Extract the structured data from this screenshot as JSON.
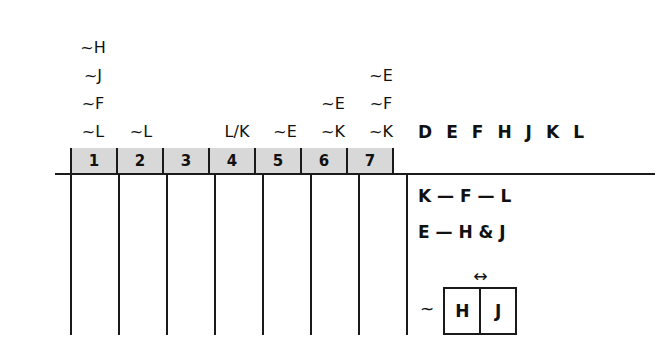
{
  "diagram": {
    "roster": {
      "label": "entity-roster",
      "entities": [
        "D",
        "E",
        "F",
        "H",
        "J",
        "K",
        "L"
      ]
    },
    "slots": {
      "numbers": [
        "1",
        "2",
        "3",
        "4",
        "5",
        "6",
        "7"
      ],
      "band_color": "#d8d8d8"
    },
    "column_annotations": [
      {
        "slot": "1",
        "notes": [
          "~H",
          "~J",
          "~F",
          "~L"
        ]
      },
      {
        "slot": "2",
        "notes": [
          "~L"
        ]
      },
      {
        "slot": "3",
        "notes": []
      },
      {
        "slot": "4",
        "notes": [
          "L/K"
        ]
      },
      {
        "slot": "5",
        "notes": [
          "~E"
        ]
      },
      {
        "slot": "6",
        "notes": [
          "~E",
          "~K"
        ]
      },
      {
        "slot": "7",
        "notes": [
          "~E",
          "~F",
          "~K"
        ]
      }
    ],
    "rules": [
      {
        "name": "chain-rule-kfl",
        "text": "K — F — L"
      },
      {
        "name": "chain-rule-ehj",
        "text": "E — H & J"
      }
    ],
    "block_rule": {
      "negation": "~",
      "arrow": "↔",
      "cells": [
        "H",
        "J"
      ]
    }
  }
}
